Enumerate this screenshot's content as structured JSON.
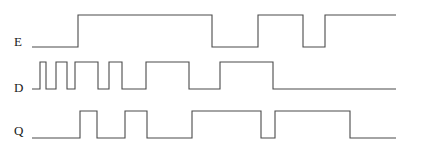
{
  "figure": {
    "type": "timing-diagram",
    "width": 424,
    "height": 155,
    "background_color": "#ffffff",
    "stroke_color": "#4a4a4a",
    "label_color": "#1a1a1a"
  },
  "signals": [
    {
      "name": "E",
      "label": "E",
      "label_x": 14,
      "label_y": 35,
      "low_y": 47,
      "high_y": 15,
      "x_start": 32,
      "x_end": 396,
      "initial_level": 0,
      "transitions": [
        {
          "x": 78,
          "level": 1
        },
        {
          "x": 212,
          "level": 0
        },
        {
          "x": 258,
          "level": 1
        },
        {
          "x": 303,
          "level": 0
        },
        {
          "x": 325,
          "level": 1
        }
      ]
    },
    {
      "name": "D",
      "label": "D",
      "label_x": 14,
      "label_y": 81,
      "low_y": 89,
      "high_y": 62,
      "x_start": 32,
      "x_end": 396,
      "initial_level": 0,
      "transitions": [
        {
          "x": 40,
          "level": 1
        },
        {
          "x": 46,
          "level": 0
        },
        {
          "x": 56,
          "level": 1
        },
        {
          "x": 67,
          "level": 0
        },
        {
          "x": 75,
          "level": 1
        },
        {
          "x": 98,
          "level": 0
        },
        {
          "x": 109,
          "level": 1
        },
        {
          "x": 122,
          "level": 0
        },
        {
          "x": 146,
          "level": 1
        },
        {
          "x": 189,
          "level": 0
        },
        {
          "x": 220,
          "level": 1
        },
        {
          "x": 273,
          "level": 0
        },
        {
          "x": 347,
          "level": 0
        }
      ]
    },
    {
      "name": "Q",
      "label": "Q",
      "label_x": 14,
      "label_y": 124,
      "low_y": 138,
      "high_y": 111,
      "x_start": 32,
      "x_end": 396,
      "initial_level": 0,
      "transitions": [
        {
          "x": 80,
          "level": 1
        },
        {
          "x": 97,
          "level": 0
        },
        {
          "x": 125,
          "level": 1
        },
        {
          "x": 147,
          "level": 0
        },
        {
          "x": 192,
          "level": 1
        },
        {
          "x": 261,
          "level": 0
        },
        {
          "x": 275,
          "level": 1
        },
        {
          "x": 350,
          "level": 0
        }
      ]
    }
  ],
  "chart_data": {
    "type": "line",
    "title": "",
    "xlabel": "",
    "ylabel": "",
    "series": [
      {
        "name": "E",
        "levels": [
          0,
          1,
          0,
          1,
          0,
          1
        ],
        "edge_x": [
          32,
          78,
          212,
          258,
          303,
          325
        ],
        "end_x": 396
      },
      {
        "name": "D",
        "levels": [
          0,
          1,
          0,
          1,
          0,
          1,
          0,
          1,
          0,
          1,
          0,
          1,
          0
        ],
        "edge_x": [
          32,
          40,
          46,
          56,
          67,
          75,
          98,
          109,
          122,
          146,
          189,
          220,
          273,
          347
        ],
        "end_x": 396
      },
      {
        "name": "Q",
        "levels": [
          0,
          1,
          0,
          1,
          0,
          1,
          0,
          1,
          0
        ],
        "edge_x": [
          32,
          80,
          97,
          125,
          147,
          192,
          261,
          275,
          350
        ],
        "end_x": 396
      }
    ],
    "legend": [
      "E",
      "D",
      "Q"
    ],
    "grid": false
  }
}
